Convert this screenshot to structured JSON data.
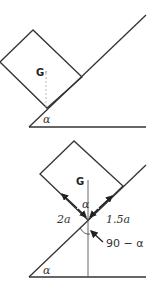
{
  "figure": {
    "top_diagram": {
      "name": "block on incline",
      "center_of_mass_label": "G",
      "angle_label": "α"
    },
    "bottom_diagram": {
      "name": "block on incline with dimensions",
      "center_of_mass_label": "G",
      "angle_label_incline": "α",
      "angle_label_vertical": "α",
      "dimension_left": "2a",
      "dimension_right": "1.5a",
      "angle_complement": "90 − α"
    },
    "colors": {
      "line": "#333333",
      "dashed": "#aaaaaa"
    }
  }
}
